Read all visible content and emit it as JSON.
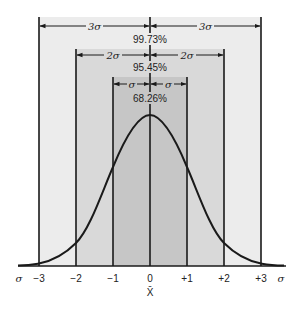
{
  "diagram": {
    "bands": [
      {
        "id": "three-sigma",
        "label_left": "3σ",
        "label_right": "3σ",
        "percent": "99.73%",
        "color": "#ececec"
      },
      {
        "id": "two-sigma",
        "label_left": "2σ",
        "label_right": "2σ",
        "percent": "95.45%",
        "color": "#d9d9d9"
      },
      {
        "id": "one-sigma",
        "label_left": "σ",
        "label_right": "σ",
        "percent": "68.26%",
        "color": "#c6c6c6"
      }
    ],
    "axis": {
      "left_unit": "σ",
      "right_unit": "σ",
      "ticks": [
        "−3",
        "−2",
        "−1",
        "0",
        "+1",
        "+2",
        "+3"
      ],
      "mean_label": "X̄"
    },
    "colors": {
      "line": "#1a1a1a",
      "text": "#222222",
      "background": "#ffffff"
    }
  }
}
